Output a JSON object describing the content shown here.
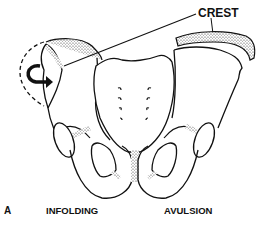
{
  "figure": {
    "panel_letter": "A",
    "labels": {
      "crest": "CREST",
      "left_caption": "INFOLDING",
      "right_caption": "AVULSION"
    },
    "colors": {
      "line": "#111111",
      "background": "#ffffff",
      "stipple": "#444444"
    }
  }
}
